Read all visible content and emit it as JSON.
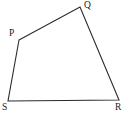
{
  "figure": {
    "kind": "geometry-diagram",
    "shape_name": "quadrilateral",
    "background_color": "#ffffff",
    "stroke_color": "#2b2b2b",
    "stroke_width": 1.1,
    "label_color": "#1a1a1a",
    "canvas": {
      "width": 128,
      "height": 118
    },
    "vertices": [
      {
        "id": "P",
        "label": "P",
        "x": 19,
        "y": 40,
        "label_x": 9,
        "label_y": 28
      },
      {
        "id": "Q",
        "label": "Q",
        "x": 80,
        "y": 7,
        "label_x": 84,
        "label_y": 0
      },
      {
        "id": "R",
        "label": "R",
        "x": 119,
        "y": 100,
        "label_x": 115,
        "label_y": 102
      },
      {
        "id": "S",
        "label": "S",
        "x": 8,
        "y": 101,
        "label_x": 2,
        "label_y": 102
      }
    ],
    "edges": [
      {
        "id": "PQ",
        "from": "P",
        "to": "Q"
      },
      {
        "id": "QR",
        "from": "Q",
        "to": "R"
      },
      {
        "id": "RS",
        "from": "R",
        "to": "S"
      },
      {
        "id": "SP",
        "from": "S",
        "to": "P"
      }
    ],
    "polygon_points": "19,40 80,7 119,100 8,101"
  }
}
